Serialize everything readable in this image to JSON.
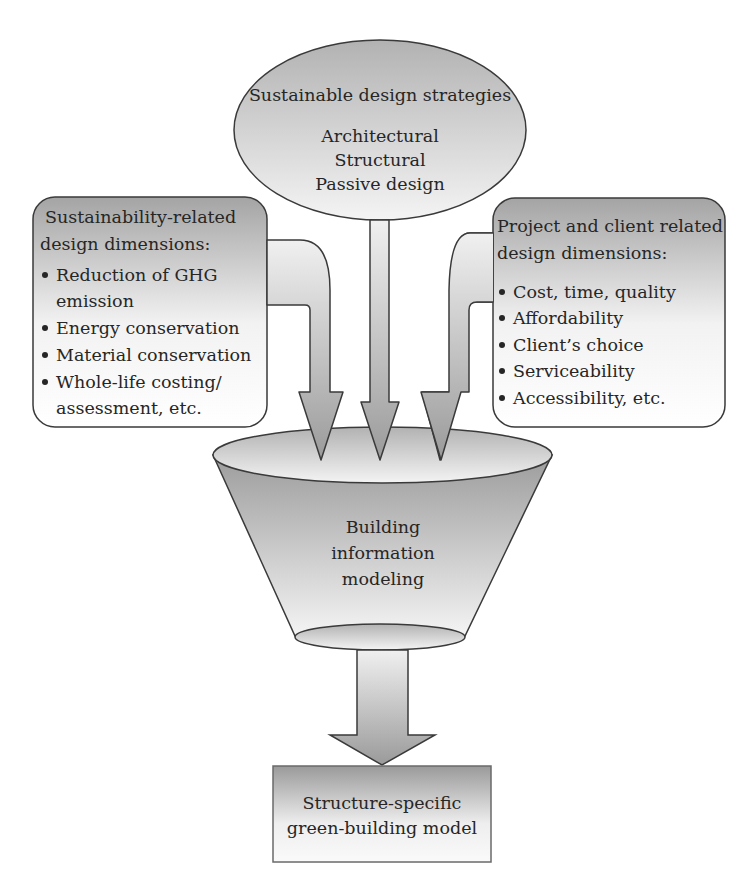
{
  "strategies": {
    "title": "Sustainable design strategies",
    "items": [
      "Architectural",
      "Structural",
      "Passive design"
    ]
  },
  "sustainability_box": {
    "title_lines": [
      "Sustainability-related",
      "design dimensions:"
    ],
    "bullets": [
      "Reduction of GHG",
      "emission",
      "Energy conservation",
      "Material conservation",
      "Whole-life costing/",
      "assessment, etc."
    ]
  },
  "project_box": {
    "title_lines": [
      "Project and client related",
      "design dimensions:"
    ],
    "bullets": [
      "Cost, time, quality",
      "Affordability",
      "Client’s choice",
      "Serviceability",
      "Accessibility, etc."
    ]
  },
  "funnel": {
    "lines": [
      "Building",
      "information",
      "modeling"
    ]
  },
  "output_box": {
    "lines": [
      "Structure-specific",
      "green-building model"
    ]
  },
  "colors": {
    "stroke": "#3a3a3a",
    "shade_dark": "#9a9a9a",
    "shade_light": "#f4f4f4",
    "text": "#262626"
  }
}
